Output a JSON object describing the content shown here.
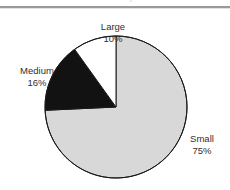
{
  "header": {
    "clipped_text": "Distribution by size",
    "rule_color": "#9a9a9a"
  },
  "chart_data": {
    "type": "pie",
    "title": "",
    "subtitle": "",
    "xlabel": "",
    "ylabel": "",
    "legend_position": "none",
    "grid": false,
    "labels_show_percent": true,
    "start_angle_deg": 90,
    "direction": "counterclockwise",
    "categories": [
      "Large",
      "Medium",
      "Small"
    ],
    "values": [
      10,
      16,
      75
    ],
    "value_suffix": "%",
    "slices": [
      {
        "name": "Large",
        "value": 10,
        "value_label": "10%",
        "fill": "#ffffff",
        "stroke": "#1a1a1a",
        "label_name": "Large",
        "label_value": "10%"
      },
      {
        "name": "Medium",
        "value": 16,
        "value_label": "16%",
        "fill": "#121212",
        "stroke": "#1a1a1a",
        "label_name": "Medium",
        "label_value": "16%"
      },
      {
        "name": "Small",
        "value": 75,
        "value_label": "75%",
        "fill": "#d8d8d8",
        "stroke": "#1a1a1a",
        "label_name": "Small",
        "label_value": "75%"
      }
    ],
    "geometry": {
      "center_x": 116,
      "center_y": 98,
      "radius": 71
    },
    "colors": {
      "large": "#ffffff",
      "medium": "#121212",
      "small": "#d8d8d8",
      "outline": "#1a1a1a",
      "text": "#2f2f2f",
      "background": "#ffffff"
    }
  }
}
